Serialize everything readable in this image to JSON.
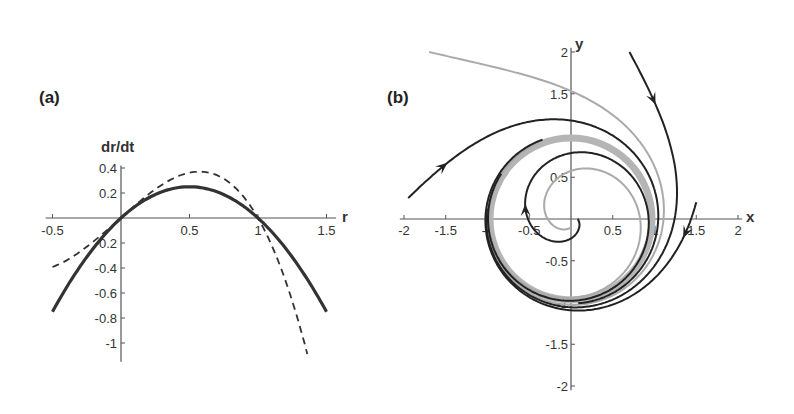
{
  "chart_data": [
    {
      "id": "a",
      "type": "line",
      "panel_label": "(a)",
      "title": "",
      "xlabel": "r",
      "ylabel": "dr/dt",
      "xlim": [
        -0.5,
        1.5
      ],
      "ylim": [
        -1.1,
        0.4
      ],
      "xticks": [
        -0.5,
        0.5,
        1,
        1.5
      ],
      "xtick_labels": [
        "-0.5",
        "0.5",
        "1",
        "1.5"
      ],
      "yticks": [
        0.4,
        0.2,
        -0.2,
        -0.4,
        -0.6,
        -0.8,
        -1
      ],
      "ytick_labels": [
        "0.4",
        "0.2",
        "-0.2",
        "-0.4",
        "-0.6",
        "-0.8",
        "-1"
      ],
      "grid": false,
      "legend": null,
      "series": [
        {
          "name": "solid",
          "style": "solid",
          "x": [
            -0.5,
            -0.25,
            0,
            0.25,
            0.5,
            0.75,
            1,
            1.25,
            1.5
          ],
          "y": [
            -0.75,
            -0.31,
            0,
            0.19,
            0.25,
            0.19,
            0,
            -0.31,
            -0.75
          ]
        },
        {
          "name": "dashed",
          "style": "dashed",
          "x": [
            -0.5,
            -0.25,
            0,
            0.25,
            0.5,
            0.6,
            0.75,
            1,
            1.2,
            1.38
          ],
          "y": [
            -0.37,
            -0.2,
            0,
            0.25,
            0.37,
            0.38,
            0.33,
            0,
            -0.45,
            -1.1
          ]
        }
      ]
    },
    {
      "id": "b",
      "type": "line",
      "panel_label": "(b)",
      "title": "",
      "xlabel": "x",
      "ylabel": "y",
      "xlim": [
        -2,
        2
      ],
      "ylim": [
        -2,
        2
      ],
      "xticks": [
        -2,
        -1.5,
        -1,
        -0.5,
        0.5,
        1,
        1.5,
        2
      ],
      "xtick_labels": [
        "-2",
        "-1.5",
        "-1",
        "-0.5",
        "0.5",
        "1",
        "1.5",
        "2"
      ],
      "yticks": [
        2,
        1.5,
        0.5,
        -0.5,
        -1,
        -1.5,
        -2
      ],
      "ytick_labels": [
        "2",
        "1.5",
        "0.5",
        "-0.5",
        "-1",
        "-1.5",
        "-2"
      ],
      "grid": false,
      "legend": null,
      "annotations": [
        "limit cycle at radius 1 (gray band)",
        "arrows show flow direction toward the cycle"
      ],
      "series": [
        {
          "name": "trajectory from (0.7, 2)",
          "color": "#222222",
          "start": [
            0.7,
            2.0
          ]
        },
        {
          "name": "trajectory from (1.5, 0.2)",
          "color": "#222222",
          "start": [
            1.5,
            0.2
          ]
        },
        {
          "name": "trajectory from (-1.95, 0.25)",
          "color": "#222222",
          "start": [
            -1.95,
            0.25
          ]
        },
        {
          "name": "trajectory from (0.05, 0.05)",
          "color": "#222222",
          "start": [
            0.08,
            0.0
          ]
        },
        {
          "name": "gray trajectory from (-1.7, 2)",
          "color": "#aaaaaa",
          "start": [
            -1.7,
            2.0
          ]
        },
        {
          "name": "gray inner spiral",
          "color": "#aaaaaa",
          "start": [
            0.0,
            -0.1
          ]
        }
      ]
    }
  ]
}
